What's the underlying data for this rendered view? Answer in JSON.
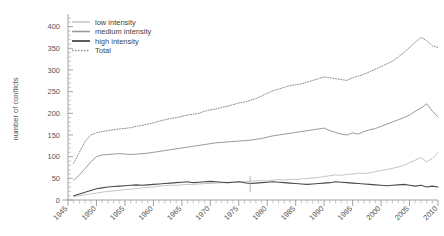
{
  "chart_data": {
    "type": "line",
    "title": "",
    "xlabel": "",
    "ylabel": "number of conflicts",
    "xlim": [
      1945,
      2010
    ],
    "ylim": [
      0,
      420
    ],
    "yticks": [
      0,
      50,
      100,
      150,
      200,
      250,
      300,
      350,
      400
    ],
    "xticks": [
      1945,
      1950,
      1955,
      1960,
      1965,
      1970,
      1975,
      1980,
      1985,
      1990,
      1995,
      2000,
      2005,
      2010
    ],
    "grid": false,
    "legend_position": "top-left",
    "minor_ticks": "yearly",
    "colors": {
      "low": "#bdbdbd",
      "medium": "#9a9a9a",
      "high": "#4a4a4a",
      "total": "#8a8a8a"
    },
    "x": [
      1946,
      1947,
      1948,
      1949,
      1950,
      1951,
      1952,
      1953,
      1954,
      1955,
      1956,
      1957,
      1958,
      1959,
      1960,
      1961,
      1962,
      1963,
      1964,
      1965,
      1966,
      1967,
      1968,
      1969,
      1970,
      1971,
      1972,
      1973,
      1974,
      1975,
      1976,
      1977,
      1978,
      1979,
      1980,
      1981,
      1982,
      1983,
      1984,
      1985,
      1986,
      1987,
      1988,
      1989,
      1990,
      1991,
      1992,
      1993,
      1994,
      1995,
      1996,
      1997,
      1998,
      1999,
      2000,
      2001,
      2002,
      2003,
      2004,
      2005,
      2006,
      2007,
      2008,
      2009,
      2010
    ],
    "series": [
      {
        "name": "low intensity",
        "key": "low",
        "style": "solid-thin",
        "values": [
          8,
          10,
          12,
          14,
          16,
          18,
          20,
          21,
          22,
          24,
          25,
          26,
          28,
          29,
          30,
          32,
          33,
          34,
          34,
          35,
          36,
          36,
          37,
          38,
          38,
          39,
          40,
          40,
          41,
          42,
          42,
          43,
          44,
          45,
          44,
          46,
          47,
          46,
          48,
          47,
          49,
          50,
          51,
          52,
          54,
          56,
          58,
          57,
          59,
          60,
          62,
          61,
          63,
          65,
          68,
          70,
          73,
          76,
          80,
          86,
          92,
          98,
          88,
          96,
          110
        ]
      },
      {
        "name": "medium intensity",
        "key": "medium",
        "style": "solid-thin",
        "values": [
          45,
          58,
          72,
          88,
          100,
          104,
          105,
          106,
          107,
          106,
          105,
          106,
          107,
          108,
          110,
          112,
          114,
          116,
          118,
          120,
          122,
          124,
          126,
          128,
          130,
          132,
          133,
          134,
          135,
          136,
          137,
          138,
          140,
          142,
          145,
          148,
          150,
          152,
          154,
          156,
          158,
          160,
          162,
          164,
          166,
          160,
          156,
          152,
          150,
          155,
          152,
          158,
          162,
          165,
          170,
          175,
          180,
          185,
          190,
          196,
          205,
          212,
          222,
          205,
          192
        ]
      },
      {
        "name": "high intensity",
        "key": "high",
        "style": "solid-thick",
        "values": [
          10,
          14,
          18,
          22,
          26,
          28,
          30,
          31,
          32,
          33,
          34,
          35,
          34,
          35,
          36,
          37,
          38,
          39,
          40,
          41,
          42,
          40,
          41,
          42,
          43,
          42,
          41,
          40,
          41,
          42,
          40,
          38,
          39,
          40,
          41,
          42,
          41,
          40,
          39,
          38,
          37,
          36,
          37,
          38,
          39,
          40,
          42,
          41,
          40,
          39,
          38,
          37,
          36,
          35,
          34,
          33,
          34,
          35,
          36,
          34,
          32,
          34,
          30,
          32,
          30
        ]
      },
      {
        "name": "Total",
        "key": "total",
        "style": "dotted",
        "values": [
          85,
          110,
          135,
          150,
          155,
          158,
          160,
          162,
          164,
          165,
          167,
          170,
          172,
          175,
          178,
          182,
          185,
          188,
          190,
          193,
          196,
          198,
          200,
          205,
          208,
          210,
          214,
          216,
          220,
          224,
          226,
          230,
          234,
          240,
          246,
          252,
          256,
          260,
          264,
          266,
          268,
          272,
          276,
          280,
          284,
          282,
          280,
          278,
          276,
          282,
          286,
          290,
          296,
          302,
          308,
          314,
          320,
          330,
          340,
          352,
          364,
          375,
          368,
          356,
          352
        ]
      }
    ]
  },
  "legend": {
    "items": [
      {
        "label": "low intensity"
      },
      {
        "label": "medium intensity"
      },
      {
        "label": "high intensity"
      },
      {
        "label": "Total"
      }
    ]
  },
  "axis": {
    "y_title": "number of conflicts"
  }
}
